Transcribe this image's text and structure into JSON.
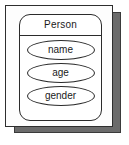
{
  "diagram": {
    "type": "er-entity",
    "entity": {
      "title": "Person",
      "attributes": [
        {
          "label": "name"
        },
        {
          "label": "age"
        },
        {
          "label": "gender"
        }
      ]
    },
    "colors": {
      "card_background": "#fdfdfd",
      "shadow_card": "#6b6b6b",
      "stroke": "#2b2b2b",
      "text": "#1a1a1a",
      "page_background": "#ffffff"
    }
  }
}
